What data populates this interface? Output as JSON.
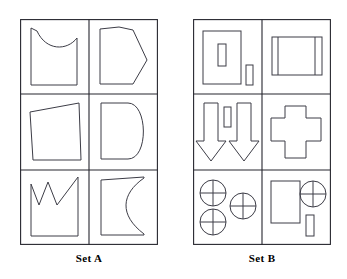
{
  "figure": {
    "type": "visual-analogy-problem",
    "background_color": "#ffffff",
    "stroke_color": "#3c3c46",
    "grid_color": "#26262e",
    "panels": [
      {
        "id": "set-a",
        "label": "Set A",
        "rows": 3,
        "columns": 2,
        "cells": [
          {
            "position": "row1-col1",
            "shape_name": "square-with-concave-top",
            "description": "Upright square whose top edge curves downward (concave)",
            "element_count": 1
          },
          {
            "position": "row1-col2",
            "shape_name": "pentagon-pointing-right",
            "description": "Home-plate pentagon with apex pointing right",
            "element_count": 1
          },
          {
            "position": "row2-col1",
            "shape_name": "trapezoid-slanted-top",
            "description": "Quadrilateral with top edge sloping upward to the right",
            "element_count": 1
          },
          {
            "position": "row2-col2",
            "shape_name": "d-shape-rounded-right",
            "description": "Rectangle with a semicircular rounded right side, like letter D",
            "element_count": 1
          },
          {
            "position": "row3-col1",
            "shape_name": "crown-zigzag-top",
            "description": "Rectangle with a zigzag crown-like top edge rising to the right",
            "element_count": 1
          },
          {
            "position": "row3-col2",
            "shape_name": "rectangle-concave-right",
            "description": "Rectangle with a deep concave curve cut into the right side",
            "element_count": 1
          }
        ]
      },
      {
        "id": "set-b",
        "label": "Set B",
        "rows": 3,
        "columns": 2,
        "cells": [
          {
            "position": "row1-col1",
            "shape_name": "rectangle-with-inner-and-outer-bars",
            "description": "Large rectangle containing a small vertical bar, plus a separate small vertical bar outside to the right",
            "element_count": 3
          },
          {
            "position": "row1-col2",
            "shape_name": "wide-rectangle-with-two-vertical-bars",
            "description": "Wide rectangle divided by two vertical lines near left and right edges",
            "element_count": 1
          },
          {
            "position": "row2-col1",
            "shape_name": "two-down-arrows-with-bar",
            "description": "Two downward pointing arrows flanking a small vertical rectangle",
            "element_count": 3
          },
          {
            "position": "row2-col2",
            "shape_name": "plus-cross",
            "description": "Greek cross / plus shape",
            "element_count": 1
          },
          {
            "position": "row3-col1",
            "shape_name": "three-crosshair-circles",
            "description": "Three circles each bisected by a vertical and a horizontal line",
            "element_count": 3
          },
          {
            "position": "row3-col2",
            "shape_name": "rectangle-circle-and-bar",
            "description": "Tall rectangle, one crosshair circle, and a small vertical bar",
            "element_count": 3
          }
        ]
      }
    ]
  }
}
